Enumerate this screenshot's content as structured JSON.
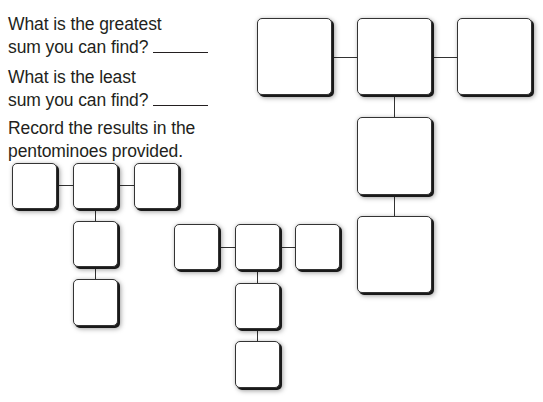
{
  "questions": [
    {
      "line1": "What is the greatest",
      "line2": "sum you can find?",
      "answer": ""
    },
    {
      "line1": "What is the least",
      "line2": "sum you can find?",
      "answer": ""
    }
  ],
  "instruction": {
    "line1": "Record the results in the",
    "line2": "pentominoes provided."
  },
  "pentominoes": [
    {
      "name": "large-t-pentomino",
      "cells": 5,
      "values": [
        "",
        "",
        "",
        "",
        ""
      ]
    },
    {
      "name": "small-t-pentomino-left",
      "cells": 5,
      "values": [
        "",
        "",
        "",
        "",
        ""
      ]
    },
    {
      "name": "small-t-pentomino-middle",
      "cells": 5,
      "values": [
        "",
        "",
        "",
        "",
        ""
      ]
    }
  ]
}
